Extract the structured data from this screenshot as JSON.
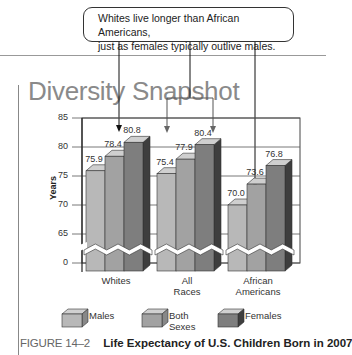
{
  "callout": {
    "line1": "Whites live longer than African Americans,",
    "line2": "just as females typically outlive males."
  },
  "title": "Diversity Snapshot",
  "caption": {
    "figure": "FIGURE 14–2",
    "text": "Life Expectancy of U.S. Children Born in 2007"
  },
  "colors": {
    "males": "#b8b8b8",
    "both_sexes": "#a2a2a2",
    "females": "#7e7e7e",
    "females_side": "#3e3e3e"
  },
  "chart_data": {
    "type": "bar",
    "title": "Diversity Snapshot",
    "xlabel": "",
    "ylabel": "Years",
    "categories": [
      "Whites",
      "All Races",
      "African Americans"
    ],
    "category_display": [
      [
        "Whites"
      ],
      [
        "All",
        "Races"
      ],
      [
        "African",
        "Americans"
      ]
    ],
    "series": [
      {
        "name": "Males",
        "values": [
          75.9,
          75.4,
          70.0
        ]
      },
      {
        "name": "Both Sexes",
        "values": [
          78.4,
          77.9,
          73.6
        ]
      },
      {
        "name": "Females",
        "values": [
          80.8,
          80.4,
          76.8
        ]
      }
    ],
    "value_labels": [
      [
        "75.9",
        "78.4",
        "80.8"
      ],
      [
        "75.4",
        "77.9",
        "80.4"
      ],
      [
        "70.0",
        "73.6",
        "76.8"
      ]
    ],
    "yticks": [
      "85",
      "80",
      "75",
      "70",
      "65",
      "0"
    ],
    "ylim": [
      0,
      85
    ],
    "axis_break": "between 0 and 65",
    "grid": true,
    "legend": [
      "Males",
      "Both Sexes",
      "Females"
    ],
    "legend_position": "bottom",
    "style": "3d-bar"
  }
}
